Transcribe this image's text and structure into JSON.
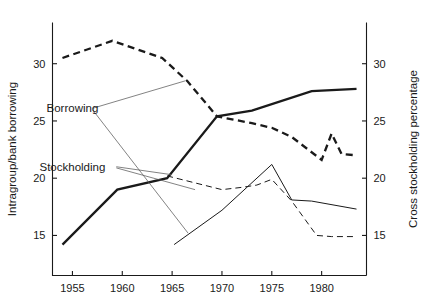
{
  "chart_data": {
    "type": "line",
    "title": "",
    "xlabel": "",
    "ylabel": "Intragroup/bank borrowing",
    "y2label": "Cross stockholding percentage",
    "xlim": [
      1953.0,
      1984.5
    ],
    "ylim": [
      11.5,
      33.6
    ],
    "y2lim": [
      11.5,
      33.6
    ],
    "grid": false,
    "legend": "none",
    "xticks": [
      1955,
      1960,
      1965,
      1970,
      1975,
      1980
    ],
    "xticklabels": [
      "1955",
      "1960",
      "1965",
      "1970",
      "1975",
      "1980"
    ],
    "yticks": [
      15,
      20,
      25,
      30
    ],
    "yticklabels": [
      "15",
      "20",
      "25",
      "30"
    ],
    "y2ticks": [
      15,
      20,
      25,
      30
    ],
    "y2ticklabels": [
      "15",
      "20",
      "25",
      "30"
    ],
    "annotations": [
      {
        "text": "Borrowing",
        "x": 1955.0,
        "y": 26.1
      },
      {
        "text": "Stockholding",
        "x": 1955.0,
        "y": 21.0
      }
    ],
    "series": [
      {
        "name": "Borrowing (intragroup/bank borrowing)",
        "axis": "left",
        "style": "solid-thick",
        "x": [
          1954.0,
          1959.5,
          1964.5,
          1969.5,
          1973.0,
          1979.0,
          1983.5
        ],
        "values": [
          14.2,
          19.0,
          20.0,
          25.4,
          25.9,
          27.6,
          27.8
        ]
      },
      {
        "name": "Borrowing (cross stockholding)",
        "axis": "right",
        "style": "dashed-thick",
        "x": [
          1954.0,
          1959.0,
          1964.0,
          1966.5,
          1969.5,
          1973.0,
          1975.0,
          1977.0,
          1980.0,
          1981.0,
          1982.0,
          1983.5
        ],
        "values": [
          30.5,
          32.0,
          30.5,
          28.5,
          25.4,
          24.8,
          24.4,
          23.6,
          21.6,
          23.9,
          22.1,
          22.0
        ]
      },
      {
        "name": "Stockholding (intragroup/bank borrowing)",
        "axis": "left",
        "style": "solid-thin",
        "x": [
          1965.2,
          1970.0,
          1975.0,
          1977.0,
          1979.0,
          1983.5
        ],
        "values": [
          14.2,
          17.2,
          21.2,
          18.1,
          18.0,
          17.3
        ]
      },
      {
        "name": "Stockholding (cross stockholding)",
        "axis": "right",
        "style": "dashed-thin",
        "x": [
          1964.5,
          1970.0,
          1972.0,
          1973.5,
          1975.0,
          1977.0,
          1979.5,
          1981.0,
          1983.5
        ],
        "values": [
          20.2,
          19.0,
          19.2,
          19.4,
          19.9,
          18.0,
          15.0,
          14.9,
          14.9
        ]
      }
    ],
    "leaders": [
      {
        "from": [
          1957.0,
          26.1
        ],
        "to": [
          1966.3,
          28.5
        ],
        "note": "Borrowing to thick dashed"
      },
      {
        "from": [
          1957.0,
          26.0
        ],
        "to": [
          1966.6,
          15.2
        ],
        "note": "Borrowing to thin solid upper branch"
      },
      {
        "from": [
          1959.4,
          21.0
        ],
        "to": [
          1965.0,
          20.3
        ],
        "note": "Stockholding to thin dashed"
      },
      {
        "from": [
          1959.4,
          20.9
        ],
        "to": [
          1967.3,
          19.0
        ],
        "note": "Stockholding to thin solid"
      }
    ]
  }
}
